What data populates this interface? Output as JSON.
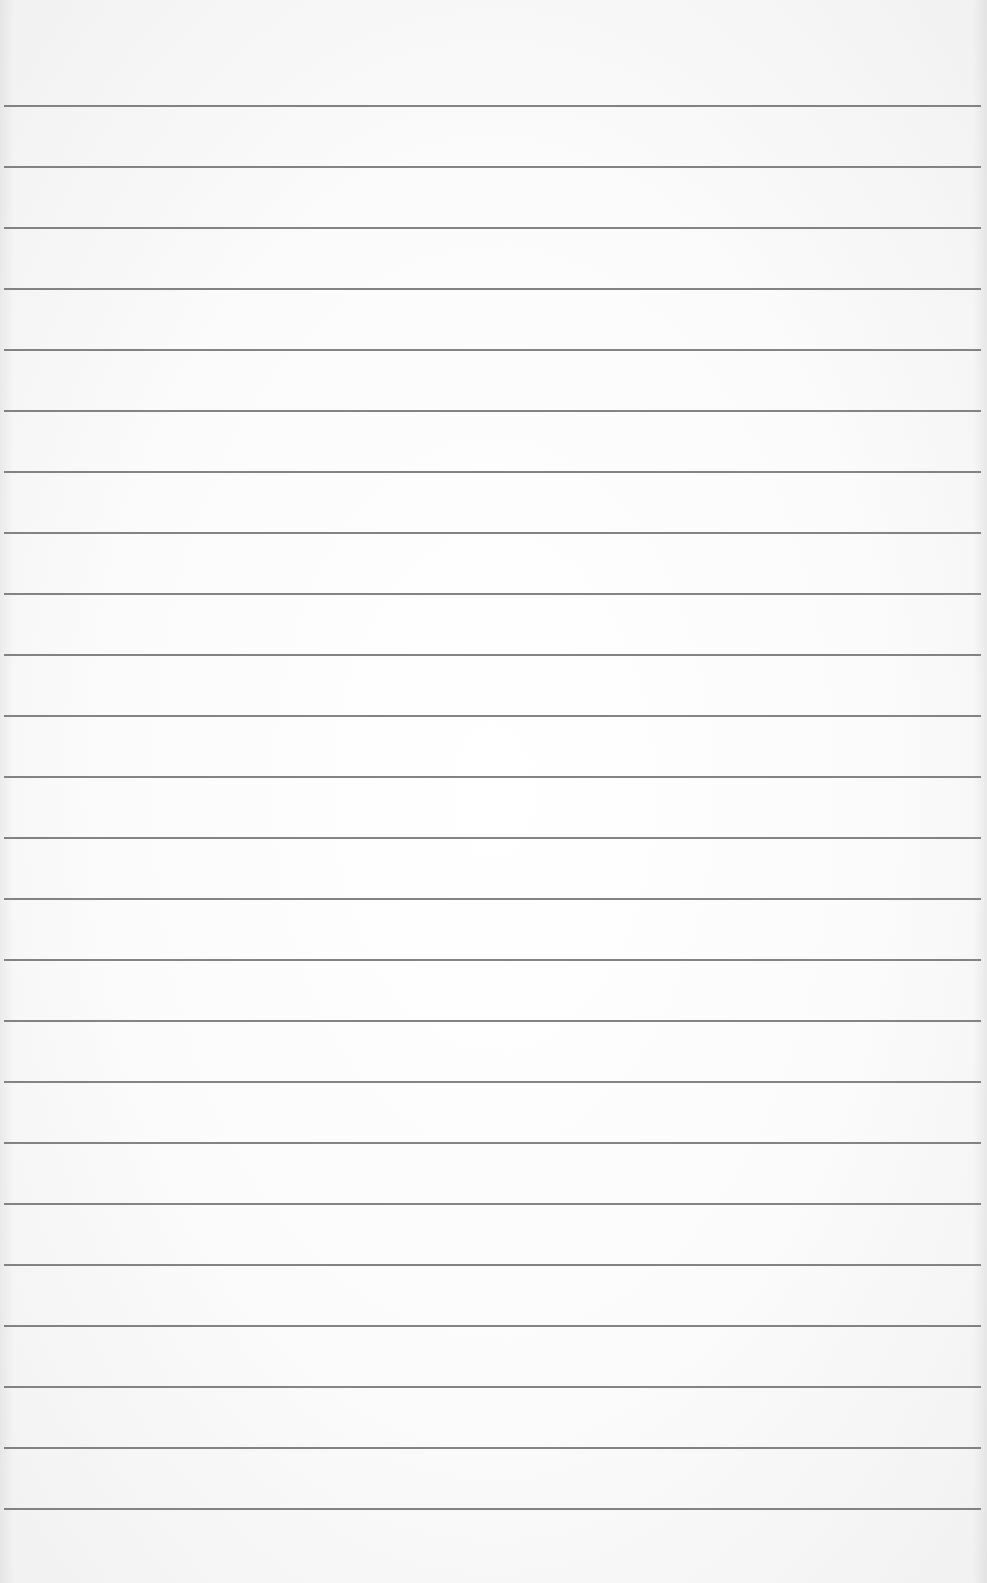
{
  "sheet": {
    "type": "ruled-paper",
    "background_color": "#fbfbfb",
    "line_color": "#6e6e6e",
    "first_line_y": 105,
    "line_spacing": 61,
    "line_count": 24,
    "text": ""
  }
}
